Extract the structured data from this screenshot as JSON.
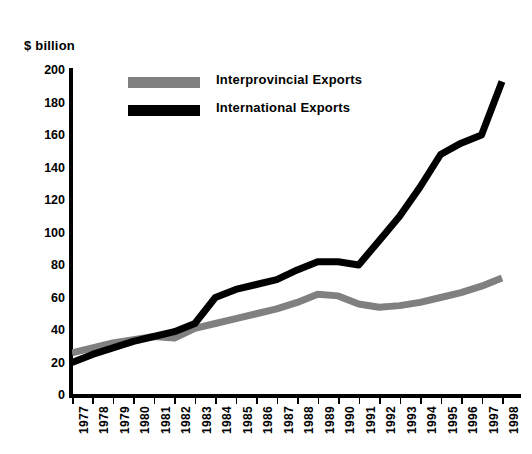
{
  "unit_label": "$ billion",
  "colors": {
    "interprovincial": "#808080",
    "international": "#000000",
    "axis": "#000000",
    "background": "#ffffff"
  },
  "legend": {
    "position": "top-center",
    "items": [
      {
        "label": "Interprovincial Exports",
        "swatch": "#808080",
        "name": "legend-interprovincial"
      },
      {
        "label": "International Exports",
        "swatch": "#000000",
        "name": "legend-international"
      }
    ]
  },
  "y_axis": {
    "label": "$ billion",
    "ticks": [
      "0",
      "20",
      "40",
      "60",
      "80",
      "100",
      "120",
      "140",
      "160",
      "180",
      "200"
    ],
    "min": 0,
    "max": 200,
    "step": 20
  },
  "x_axis": {
    "ticks": [
      "1977",
      "1978",
      "1979",
      "1980",
      "1981",
      "1982",
      "1983",
      "1984",
      "1985",
      "1986",
      "1987",
      "1988",
      "1989",
      "1990",
      "1991",
      "1992",
      "1993",
      "1994",
      "1995",
      "1996",
      "1997",
      "1998"
    ]
  },
  "chart_data": {
    "type": "line",
    "title": "",
    "subtitle": "",
    "xlabel": "",
    "ylabel": "$ billion",
    "ylim": [
      0,
      200
    ],
    "xlim": [
      "1977",
      "1998"
    ],
    "grid": false,
    "legend_position": "top-center",
    "categories": [
      "1977",
      "1978",
      "1979",
      "1980",
      "1981",
      "1982",
      "1983",
      "1984",
      "1985",
      "1986",
      "1987",
      "1988",
      "1989",
      "1990",
      "1991",
      "1992",
      "1993",
      "1994",
      "1995",
      "1996",
      "1997",
      "1998"
    ],
    "series": [
      {
        "name": "Interprovincial Exports",
        "color": "#808080",
        "values": [
          26,
          29,
          32,
          34,
          36,
          35,
          41,
          44,
          47,
          50,
          53,
          57,
          62,
          61,
          56,
          54,
          55,
          57,
          60,
          63,
          67,
          72
        ]
      },
      {
        "name": "International Exports",
        "color": "#000000",
        "values": [
          20,
          25,
          29,
          33,
          36,
          39,
          44,
          60,
          65,
          68,
          71,
          77,
          82,
          82,
          80,
          95,
          110,
          128,
          148,
          155,
          160,
          193
        ]
      }
    ]
  }
}
